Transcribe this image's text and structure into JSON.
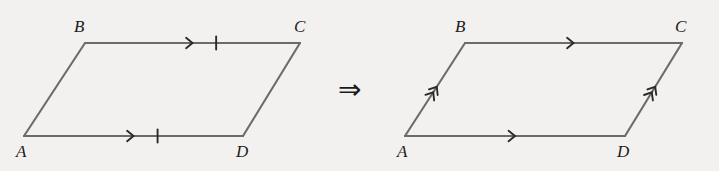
{
  "figure": {
    "background_color": "#f2f1f0",
    "stroke_color": "#6b6b6b",
    "mark_color": "#2a2a2a",
    "label_color": "#1b1b1b",
    "connector": {
      "symbol": "⇒",
      "name": "implies-arrow",
      "x": 338,
      "y": 76
    },
    "panels": [
      {
        "id": "left",
        "name": "left-parallelogram",
        "vertices": {
          "A": {
            "label": "A",
            "x": 24,
            "y": 136,
            "label_x": 16,
            "label_y": 143
          },
          "B": {
            "label": "B",
            "x": 85,
            "y": 43,
            "label_x": 74,
            "label_y": 18
          },
          "C": {
            "label": "C",
            "x": 300,
            "y": 43,
            "label_x": 294,
            "label_y": 18
          },
          "D": {
            "label": "D",
            "x": 243,
            "y": 136,
            "label_x": 236,
            "label_y": 143
          }
        },
        "edges": [
          {
            "name": "edge-AB",
            "from": "A",
            "to": "B",
            "arrows": 0,
            "ticks": 0
          },
          {
            "name": "edge-BC",
            "from": "B",
            "to": "C",
            "arrows": 1,
            "ticks": 1
          },
          {
            "name": "edge-DC",
            "from": "D",
            "to": "C",
            "arrows": 0,
            "ticks": 0
          },
          {
            "name": "edge-AD",
            "from": "A",
            "to": "D",
            "arrows": 1,
            "ticks": 1
          }
        ]
      },
      {
        "id": "right",
        "name": "right-parallelogram",
        "vertices": {
          "A": {
            "label": "A",
            "x": 405,
            "y": 136,
            "label_x": 397,
            "label_y": 143
          },
          "B": {
            "label": "B",
            "x": 465,
            "y": 43,
            "label_x": 455,
            "label_y": 18
          },
          "C": {
            "label": "C",
            "x": 682,
            "y": 43,
            "label_x": 675,
            "label_y": 18
          },
          "D": {
            "label": "D",
            "x": 625,
            "y": 136,
            "label_x": 617,
            "label_y": 143
          }
        },
        "edges": [
          {
            "name": "edge-AB",
            "from": "A",
            "to": "B",
            "arrows": 2,
            "ticks": 0
          },
          {
            "name": "edge-BC",
            "from": "B",
            "to": "C",
            "arrows": 1,
            "ticks": 0
          },
          {
            "name": "edge-DC",
            "from": "D",
            "to": "C",
            "arrows": 2,
            "ticks": 0
          },
          {
            "name": "edge-AD",
            "from": "A",
            "to": "D",
            "arrows": 1,
            "ticks": 0
          }
        ]
      }
    ]
  }
}
